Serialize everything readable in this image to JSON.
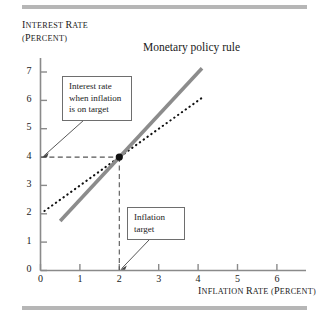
{
  "figure": {
    "y_axis_label_line1": "INTEREST RATE",
    "y_axis_label_line2": "(PERCENT)",
    "x_axis_label": "INFLATION RATE (PERCENT)",
    "policy_rule_label": "Monetary policy rule",
    "callout_interest_rate": {
      "line1": "Interest rate",
      "line2": "when inflation",
      "line3": "is on target"
    },
    "callout_inflation_target": {
      "line1": "Inflation",
      "line2": "target"
    },
    "colors": {
      "policy_rule_line": "#8c8c8c",
      "dotted_line": "#111111",
      "guide_line": "#555555",
      "axis": "#8a8a8a",
      "rule_bar": "#b6b6b6",
      "marker": "#111111"
    }
  },
  "chart_data": {
    "type": "line",
    "title": "",
    "xlabel": "INFLATION RATE (PERCENT)",
    "ylabel": "INTEREST RATE (PERCENT)",
    "xlim": [
      0,
      6.6
    ],
    "ylim": [
      0,
      7.6
    ],
    "xticks": [
      0,
      1,
      2,
      3,
      4,
      5,
      6
    ],
    "yticks": [
      0,
      1,
      2,
      3,
      4,
      5,
      6,
      7
    ],
    "xtick_labels": [
      "0",
      "1",
      "2",
      "3",
      "4",
      "5",
      "6"
    ],
    "ytick_labels": [
      "0",
      "1",
      "2",
      "3",
      "4",
      "5",
      "6",
      "7"
    ],
    "grid": false,
    "legend": "none",
    "series": [
      {
        "name": "Monetary policy rule",
        "style": "solid-thick-gray",
        "slope": 1.5,
        "intercept": 1.0,
        "x": [
          0.5,
          4.1
        ],
        "y": [
          1.75,
          7.15
        ]
      },
      {
        "name": "45-degree reference line",
        "style": "dotted-black",
        "slope": 1.0,
        "intercept": 2.0,
        "x": [
          0.1,
          4.15
        ],
        "y": [
          2.1,
          6.15
        ]
      }
    ],
    "annotations": [
      {
        "name": "equilibrium-point",
        "x": 2,
        "y": 4,
        "marker": "filled-circle"
      },
      {
        "name": "guide-line-horizontal",
        "from": [
          0,
          4
        ],
        "to": [
          2,
          4
        ],
        "style": "dashed"
      },
      {
        "name": "guide-line-vertical",
        "from": [
          2,
          0
        ],
        "to": [
          2,
          4
        ],
        "style": "dashed"
      },
      {
        "name": "callout-interest-rate",
        "text": "Interest rate when inflation is on target",
        "points_to": [
          0,
          4
        ]
      },
      {
        "name": "callout-inflation-target",
        "text": "Inflation target",
        "points_to": [
          2,
          0
        ]
      }
    ]
  }
}
